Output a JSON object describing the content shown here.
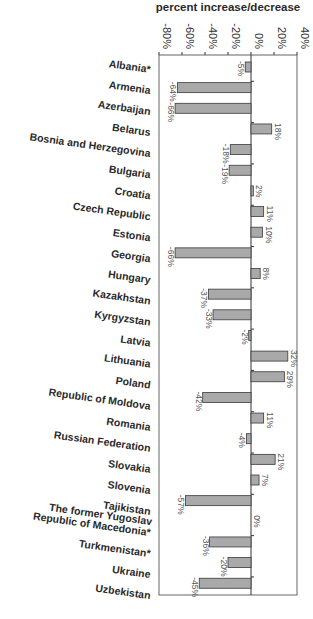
{
  "chart_data": {
    "type": "bar",
    "orientation": "horizontal",
    "title": "percent increase/decrease",
    "xlabel": "percent increase/decrease",
    "ylabel": "",
    "xlim": [
      -80,
      40
    ],
    "x_ticks": [
      -80,
      -60,
      -40,
      -20,
      0,
      20,
      40
    ],
    "x_tick_labels": [
      "-80%",
      "-60%",
      "-40%",
      "-20%",
      "0%",
      "20%",
      "40%"
    ],
    "grid": false,
    "legend": "none",
    "categories": [
      "Albania*",
      "Armenia",
      "Azerbaijan",
      "Belarus",
      "Bosnia and Herzegovina",
      "Bulgaria",
      "Croatia",
      "Czech Republic",
      "Estonia",
      "Georgia",
      "Hungary",
      "Kazakhstan",
      "Kyrgyzstan",
      "Latvia",
      "Lithuania",
      "Poland",
      "Republic of Moldova",
      "Romania",
      "Russian Federation",
      "Slovakia",
      "Slovenia",
      "Tajikistan",
      "The former Yugoslav Republic of Macedonia*",
      "Turkmenistan*",
      "Ukraine",
      "Uzbekistan"
    ],
    "category_label_lines": [
      [
        "Albania*"
      ],
      [
        "Armenia"
      ],
      [
        "Azerbaijan"
      ],
      [
        "Belarus"
      ],
      [
        "Bosnia and Herzegovina"
      ],
      [
        "Bulgaria"
      ],
      [
        "Croatia"
      ],
      [
        "Czech Republic"
      ],
      [
        "Estonia"
      ],
      [
        "Georgia"
      ],
      [
        "Hungary"
      ],
      [
        "Kazakhstan"
      ],
      [
        "Kyrgyzstan"
      ],
      [
        "Latvia"
      ],
      [
        "Lithuania"
      ],
      [
        "Poland"
      ],
      [
        "Republic of Moldova"
      ],
      [
        "Romania"
      ],
      [
        "Russian Federation"
      ],
      [
        "Slovakia"
      ],
      [
        "Slovenia"
      ],
      [
        "Tajikistan"
      ],
      [
        "The former Yugoslav",
        "Republic of Macedonia*"
      ],
      [
        "Turkmenistan*"
      ],
      [
        "Ukraine"
      ],
      [
        "Uzbekistan"
      ]
    ],
    "values": [
      -5,
      -64,
      -66,
      18,
      -18,
      -19,
      2,
      11,
      10,
      -66,
      8,
      -37,
      -33,
      -2,
      32,
      29,
      -42,
      11,
      -4,
      21,
      7,
      -57,
      0,
      -36,
      -20,
      -45
    ],
    "data_labels": [
      "-5%",
      "-64%",
      "-66%",
      "18%",
      "-18%",
      "-19%",
      "2%",
      "11%",
      "10%",
      "-66%",
      "8%",
      "-37%",
      "-33%",
      "-2%",
      "32%",
      "29%",
      "-42%",
      "11%",
      "-4%",
      "21%",
      "7%",
      "-57%",
      "0%",
      "-36%",
      "-20%",
      "-45%"
    ],
    "colors": {
      "bar_fill": "#a9a9a9",
      "bar_stroke": "#3a3a3a"
    }
  }
}
